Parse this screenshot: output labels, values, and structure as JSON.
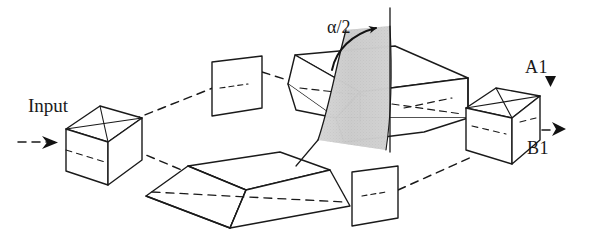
{
  "figure": {
    "kind": "optical-interferometer-schematic",
    "width": 589,
    "height": 236,
    "background_color": "#ffffff",
    "line_color": "#1a1a1a",
    "shade_color": "#c9c9c9"
  },
  "labels": {
    "input": "Input",
    "angle": "α/2",
    "output_a": "A1",
    "output_b": "B1"
  },
  "components": [
    {
      "id": "input-beamsplitter-cube",
      "name": "Input beam-splitter cube",
      "shape": "cube-with-diagonal",
      "position": [
        100,
        140
      ]
    },
    {
      "id": "upper-left-plate",
      "name": "Upper left plate",
      "shape": "parallelogram-plate",
      "position": [
        232,
        90
      ]
    },
    {
      "id": "central-prism-box",
      "name": "Central rotating prism box",
      "shape": "chamfered-box",
      "position": [
        380,
        95
      ]
    },
    {
      "id": "bottom-trapezoid-prism",
      "name": "Bottom trapezoidal prism",
      "shape": "truncated-wedge",
      "position": [
        245,
        185
      ]
    },
    {
      "id": "lower-right-plate",
      "name": "Lower right plate",
      "shape": "parallelogram-plate",
      "position": [
        372,
        194
      ]
    },
    {
      "id": "output-beamsplitter-cube",
      "name": "Output beam-splitter cube",
      "shape": "cube-with-diagonal",
      "position": [
        497,
        122
      ]
    }
  ],
  "beam_path": {
    "style": "dashed",
    "description": "Input beam enters left cube, splits into upper and lower arms, recombines at right cube producing outputs A1 and B1"
  },
  "rotation_indicator": {
    "label": "α/2",
    "axis": "vertical",
    "sweep": "shaded curved surface",
    "arrow": "curved-arrow-head"
  }
}
